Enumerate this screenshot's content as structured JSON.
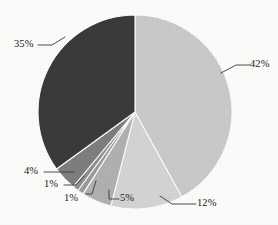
{
  "chart_data": {
    "type": "pie",
    "title": "",
    "subtitle": "",
    "xlabel": "",
    "ylabel": "",
    "legend_position": "none",
    "grid": false,
    "start_angle_deg": 0,
    "direction": "clockwise",
    "units": "percent",
    "total": 100,
    "categories": [
      "42%",
      "12%",
      "5%",
      "1%",
      "1%",
      "4%",
      "35%"
    ],
    "values": [
      42,
      12,
      5,
      1,
      1,
      4,
      35
    ],
    "labels": [
      "42%",
      "12%",
      "5%",
      "1%",
      "1%",
      "4%",
      "35%"
    ],
    "colors": [
      "#c9c9c9",
      "#d3d3d3",
      "#b0b0b0",
      "#9a9a9a",
      "#8f8f8f",
      "#7e7e7e",
      "#3a3a3a"
    ],
    "slices": [
      {
        "label": "42%",
        "value": 42,
        "color": "#c9c9c9"
      },
      {
        "label": "12%",
        "value": 12,
        "color": "#d3d3d3"
      },
      {
        "label": "5%",
        "value": 5,
        "color": "#b0b0b0"
      },
      {
        "label": "1%",
        "value": 1,
        "color": "#9a9a9a"
      },
      {
        "label": "1%",
        "value": 1,
        "color": "#8f8f8f"
      },
      {
        "label": "4%",
        "value": 4,
        "color": "#7e7e7e"
      },
      {
        "label": "35%",
        "value": 35,
        "color": "#3a3a3a"
      }
    ]
  },
  "figure": {
    "background": "#fbfbfa",
    "center_x": 135,
    "center_y": 112,
    "radius": 97
  },
  "annotations": {
    "label_42": "42%",
    "label_12": "12%",
    "label_5": "5%",
    "label_1a": "1%",
    "label_1b": "1%",
    "label_4": "4%",
    "label_35": "35%"
  }
}
